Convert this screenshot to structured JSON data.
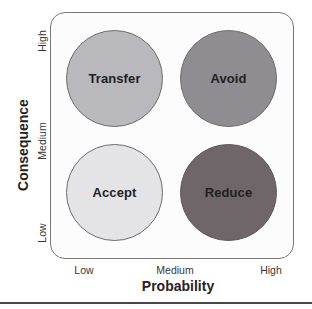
{
  "diagram": {
    "type": "risk-response-matrix",
    "x_axis": {
      "title": "Probability",
      "ticks": [
        "Low",
        "Medium",
        "High"
      ]
    },
    "y_axis": {
      "title": "Consequence",
      "ticks": [
        "Low",
        "Medium",
        "High"
      ]
    },
    "quadrants": [
      {
        "label": "Transfer",
        "probability": "Low",
        "consequence": "High",
        "fill": "#b9b8bc"
      },
      {
        "label": "Avoid",
        "probability": "High",
        "consequence": "High",
        "fill": "#8f8d91"
      },
      {
        "label": "Accept",
        "probability": "Low",
        "consequence": "Low",
        "fill": "#e4e4e7"
      },
      {
        "label": "Reduce",
        "probability": "High",
        "consequence": "Low",
        "fill": "#6e6669"
      }
    ],
    "colors": {
      "frame_border": "#7a7779",
      "text": "#231f20",
      "rule": "#4a4648"
    }
  }
}
